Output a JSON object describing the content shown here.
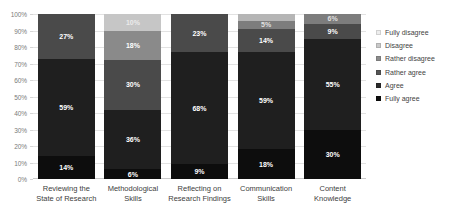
{
  "chart_data": {
    "type": "bar",
    "title": "",
    "xlabel": "",
    "ylabel": "",
    "ylim": [
      0,
      100
    ],
    "grid": true,
    "stacked": true,
    "stack_order": "bottom-to-top: Fully agree, Agree, Rather agree, Rather disagree, Disagree, Fully disagree",
    "legend_position": "right",
    "categories": [
      "Reviewing the State of Research",
      "Methodological Skills",
      "Reflecting on Research Findings",
      "Communication Skills",
      "Content Knowledge"
    ],
    "y_ticks": [
      "0%",
      "10%",
      "20%",
      "30%",
      "40%",
      "50%",
      "60%",
      "70%",
      "80%",
      "90%",
      "100%"
    ],
    "series": [
      {
        "name": "Fully agree",
        "color": "#0d0d0d",
        "values": [
          14,
          6,
          9,
          18,
          30
        ]
      },
      {
        "name": "Agree",
        "color": "#1f1f1f",
        "values": [
          59,
          36,
          68,
          59,
          55
        ]
      },
      {
        "name": "Rather agree",
        "color": "#4a4a4a",
        "values": [
          27,
          30,
          23,
          14,
          9
        ]
      },
      {
        "name": "Rather disagree",
        "color": "#737373",
        "values": [
          0,
          18,
          0,
          5,
          6
        ]
      },
      {
        "name": "Disagree",
        "color": "#a6a6a6",
        "values": [
          0,
          10,
          0,
          4,
          0
        ]
      },
      {
        "name": "Fully disagree",
        "color": "#d9d9d9",
        "values": [
          0,
          0,
          0,
          0,
          0
        ]
      }
    ],
    "bars": [
      {
        "category": "Reviewing the State of Research",
        "category_lines": [
          "Reviewing the",
          "State of Research"
        ],
        "segments": [
          {
            "label": "14%",
            "value": 14,
            "series": "Fully agree",
            "color": "#0d0d0d",
            "show_label": true
          },
          {
            "label": "59%",
            "value": 59,
            "series": "Agree",
            "color": "#1f1f1f",
            "show_label": true
          },
          {
            "label": "27%",
            "value": 27,
            "series": "Rather agree",
            "color": "#4a4a4a",
            "show_label": true
          }
        ]
      },
      {
        "category": "Methodological Skills",
        "category_lines": [
          "Methodological",
          "Skills"
        ],
        "segments": [
          {
            "label": "6%",
            "value": 6,
            "series": "Fully agree",
            "color": "#0d0d0d",
            "show_label": true
          },
          {
            "label": "36%",
            "value": 36,
            "series": "Agree",
            "color": "#1f1f1f",
            "show_label": true
          },
          {
            "label": "30%",
            "value": 30,
            "series": "Rather agree",
            "color": "#4a4a4a",
            "show_label": true
          },
          {
            "label": "18%",
            "value": 18,
            "series": "Rather disagree",
            "color": "#8a8a8a",
            "show_label": true
          },
          {
            "label": "10%",
            "value": 10,
            "series": "Disagree",
            "color": "#c6c6c6",
            "show_label": true,
            "faint_label": true
          }
        ]
      },
      {
        "category": "Reflecting on Research Findings",
        "category_lines": [
          "Reflecting on",
          "Research Findings"
        ],
        "segments": [
          {
            "label": "9%",
            "value": 9,
            "series": "Fully agree",
            "color": "#0d0d0d",
            "show_label": true
          },
          {
            "label": "68%",
            "value": 68,
            "series": "Agree",
            "color": "#1f1f1f",
            "show_label": true
          },
          {
            "label": "23%",
            "value": 23,
            "series": "Rather agree",
            "color": "#4a4a4a",
            "show_label": true
          }
        ]
      },
      {
        "category": "Communication Skills",
        "category_lines": [
          "Communication",
          "Skills"
        ],
        "segments": [
          {
            "label": "18%",
            "value": 18,
            "series": "Fully agree",
            "color": "#0d0d0d",
            "show_label": true
          },
          {
            "label": "59%",
            "value": 59,
            "series": "Agree",
            "color": "#1f1f1f",
            "show_label": true
          },
          {
            "label": "14%",
            "value": 14,
            "series": "Rather agree",
            "color": "#4a4a4a",
            "show_label": true
          },
          {
            "label": "5%",
            "value": 5,
            "series": "Rather disagree",
            "color": "#7d7d7d",
            "show_label": true,
            "faint_label": true
          },
          {
            "label": "",
            "value": 4,
            "series": "Disagree",
            "color": "#b5b5b5",
            "show_label": false
          }
        ]
      },
      {
        "category": "Content Knowledge",
        "category_lines": [
          "Content",
          "Knowledge"
        ],
        "segments": [
          {
            "label": "30%",
            "value": 30,
            "series": "Fully agree",
            "color": "#0d0d0d",
            "show_label": true
          },
          {
            "label": "55%",
            "value": 55,
            "series": "Agree",
            "color": "#1f1f1f",
            "show_label": true
          },
          {
            "label": "9%",
            "value": 9,
            "series": "Rather agree",
            "color": "#4a4a4a",
            "show_label": true
          },
          {
            "label": "6%",
            "value": 6,
            "series": "Rather disagree",
            "color": "#7d7d7d",
            "show_label": true,
            "faint_label": true
          }
        ]
      }
    ]
  },
  "legend": {
    "items": [
      {
        "label": "Fully disagree",
        "color": "#ededed"
      },
      {
        "label": "Disagree",
        "color": "#c9c9c9"
      },
      {
        "label": "Rather disagree",
        "color": "#8c8c8c"
      },
      {
        "label": "Rather agree",
        "color": "#555555"
      },
      {
        "label": "Agree",
        "color": "#2b2b2b"
      },
      {
        "label": "Fully agree",
        "color": "#0d0d0d"
      }
    ]
  }
}
